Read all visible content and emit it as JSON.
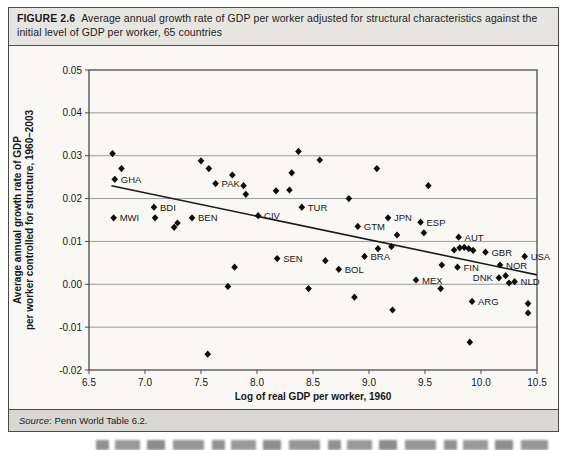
{
  "figure": {
    "label": "FIGURE 2.6",
    "title": "Average annual growth rate of GDP per worker adjusted for structural characteristics against the initial level of GDP per worker, 65 countries",
    "source_label": "Source",
    "source_text": ": Penn World Table 6.2."
  },
  "chart_data": {
    "type": "scatter",
    "title": "",
    "xlabel": "Log of real GDP per worker, 1960",
    "ylabel_line1": "Average annual growth rate of GDP",
    "ylabel_line2": "per worker controlled for structure, 1960–2003",
    "xlim": [
      6.5,
      10.5
    ],
    "ylim": [
      -0.02,
      0.05
    ],
    "grid": "horizontal",
    "legend": "none",
    "marker": "diamond",
    "marker_color": "#0d0d0d",
    "grid_color": "#9b9b9b",
    "axis_color": "#4a4a4a",
    "x_ticks": [
      {
        "v": 6.5,
        "label": "6.5"
      },
      {
        "v": 7.0,
        "label": "7.0"
      },
      {
        "v": 7.5,
        "label": "7.5"
      },
      {
        "v": 8.0,
        "label": "8.0"
      },
      {
        "v": 8.5,
        "label": "8.5"
      },
      {
        "v": 9.0,
        "label": "9.0"
      },
      {
        "v": 9.5,
        "label": "9.5"
      },
      {
        "v": 10.0,
        "label": "10.0"
      },
      {
        "v": 10.5,
        "label": "10.5"
      }
    ],
    "y_ticks": [
      {
        "v": 0.05,
        "label": "0.05"
      },
      {
        "v": 0.04,
        "label": "0.04"
      },
      {
        "v": 0.03,
        "label": "0.03"
      },
      {
        "v": 0.02,
        "label": "0.02"
      },
      {
        "v": 0.01,
        "label": "0.01"
      },
      {
        "v": 0.0,
        "label": "0.00"
      },
      {
        "v": -0.01,
        "label": "-0.01"
      },
      {
        "v": -0.02,
        "label": "-0.02"
      }
    ],
    "trend_line": {
      "x1": 6.7,
      "y1": 0.023,
      "x2": 10.5,
      "y2": 0.0022
    },
    "points": [
      {
        "x": 6.71,
        "y": 0.0305
      },
      {
        "x": 6.79,
        "y": 0.027
      },
      {
        "x": 6.73,
        "y": 0.0245,
        "label": "GHA"
      },
      {
        "x": 6.72,
        "y": 0.0155,
        "label": "MWI"
      },
      {
        "x": 7.08,
        "y": 0.018,
        "label": "BDI"
      },
      {
        "x": 7.09,
        "y": 0.0155
      },
      {
        "x": 7.26,
        "y": 0.0133
      },
      {
        "x": 7.29,
        "y": 0.0143
      },
      {
        "x": 7.42,
        "y": 0.0155,
        "label": "BEN"
      },
      {
        "x": 7.5,
        "y": 0.0288
      },
      {
        "x": 7.57,
        "y": 0.027
      },
      {
        "x": 7.63,
        "y": 0.0235,
        "label": "PAK"
      },
      {
        "x": 7.78,
        "y": 0.0255
      },
      {
        "x": 7.88,
        "y": 0.023
      },
      {
        "x": 7.9,
        "y": 0.021
      },
      {
        "x": 8.01,
        "y": 0.016,
        "label": "CIV"
      },
      {
        "x": 8.17,
        "y": 0.0218
      },
      {
        "x": 8.29,
        "y": 0.022
      },
      {
        "x": 8.31,
        "y": 0.026
      },
      {
        "x": 8.37,
        "y": 0.031
      },
      {
        "x": 8.4,
        "y": 0.018,
        "label": "TUR"
      },
      {
        "x": 8.56,
        "y": 0.029
      },
      {
        "x": 8.82,
        "y": 0.02
      },
      {
        "x": 9.07,
        "y": 0.027
      },
      {
        "x": 9.53,
        "y": 0.023
      },
      {
        "x": 8.9,
        "y": 0.0135,
        "label": "GTM"
      },
      {
        "x": 9.17,
        "y": 0.0155,
        "label": "JPN"
      },
      {
        "x": 9.46,
        "y": 0.0145,
        "label": "ESP"
      },
      {
        "x": 9.25,
        "y": 0.0115
      },
      {
        "x": 9.49,
        "y": 0.012
      },
      {
        "x": 9.8,
        "y": 0.011,
        "label": "AUT"
      },
      {
        "x": 8.18,
        "y": 0.006,
        "label": "SEN"
      },
      {
        "x": 7.8,
        "y": 0.004
      },
      {
        "x": 7.74,
        "y": -0.0005
      },
      {
        "x": 7.56,
        "y": -0.0163
      },
      {
        "x": 8.46,
        "y": -0.001
      },
      {
        "x": 8.61,
        "y": 0.0055
      },
      {
        "x": 8.73,
        "y": 0.0035,
        "label": "BOL"
      },
      {
        "x": 8.96,
        "y": 0.0065,
        "label": "BRA"
      },
      {
        "x": 9.08,
        "y": 0.0083
      },
      {
        "x": 9.2,
        "y": 0.0088
      },
      {
        "x": 9.65,
        "y": 0.0045
      },
      {
        "x": 9.79,
        "y": 0.004,
        "label": "FIN"
      },
      {
        "x": 9.76,
        "y": 0.008
      },
      {
        "x": 9.81,
        "y": 0.0085
      },
      {
        "x": 9.85,
        "y": 0.0086
      },
      {
        "x": 9.89,
        "y": 0.0083
      },
      {
        "x": 9.93,
        "y": 0.0079
      },
      {
        "x": 10.04,
        "y": 0.0075,
        "label": "GBR"
      },
      {
        "x": 10.17,
        "y": 0.0045,
        "label": "NOR"
      },
      {
        "x": 10.39,
        "y": 0.0065,
        "label": "USA"
      },
      {
        "x": 10.16,
        "y": 0.0015,
        "label": "DNK",
        "side": "left"
      },
      {
        "x": 10.22,
        "y": 0.002
      },
      {
        "x": 10.25,
        "y": 0.0003
      },
      {
        "x": 10.3,
        "y": 0.0006,
        "label": "NLD"
      },
      {
        "x": 9.42,
        "y": 0.001,
        "label": "MEX"
      },
      {
        "x": 9.64,
        "y": -0.001
      },
      {
        "x": 8.87,
        "y": -0.003
      },
      {
        "x": 9.21,
        "y": -0.006
      },
      {
        "x": 9.92,
        "y": -0.004,
        "label": "ARG"
      },
      {
        "x": 9.9,
        "y": -0.0135
      },
      {
        "x": 10.42,
        "y": -0.0045
      },
      {
        "x": 10.42,
        "y": -0.0067
      }
    ]
  }
}
